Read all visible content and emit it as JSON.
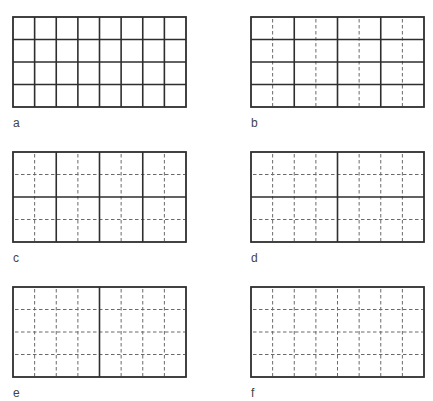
{
  "figure": {
    "grid": {
      "cols": 8,
      "rows": 4,
      "width": 173,
      "height": 90
    },
    "colors": {
      "solid": "#2e2e2e",
      "dashed": "#6a6a6a",
      "background": "#ffffff"
    },
    "panels": [
      {
        "label": "a",
        "x": 13,
        "y": 17,
        "solid_v": [
          1,
          2,
          3,
          4,
          5,
          6,
          7
        ],
        "solid_h": [
          1,
          2,
          3
        ],
        "dashed_v": [],
        "dashed_h": []
      },
      {
        "label": "b",
        "x": 251,
        "y": 17,
        "solid_v": [
          2,
          4,
          6
        ],
        "solid_h": [
          1,
          2,
          3
        ],
        "dashed_v": [
          1,
          3,
          5,
          7
        ],
        "dashed_h": []
      },
      {
        "label": "c",
        "x": 13,
        "y": 152,
        "solid_v": [
          2,
          4,
          6
        ],
        "solid_h": [
          2
        ],
        "dashed_v": [
          1,
          3,
          5,
          7
        ],
        "dashed_h": [
          1,
          3
        ]
      },
      {
        "label": "d",
        "x": 251,
        "y": 152,
        "solid_v": [
          4
        ],
        "solid_h": [
          2
        ],
        "dashed_v": [
          1,
          2,
          3,
          5,
          6,
          7
        ],
        "dashed_h": [
          1,
          3
        ]
      },
      {
        "label": "e",
        "x": 13,
        "y": 287,
        "solid_v": [
          4
        ],
        "solid_h": [],
        "dashed_v": [
          1,
          2,
          3,
          5,
          6,
          7
        ],
        "dashed_h": [
          1,
          2,
          3
        ]
      },
      {
        "label": "f",
        "x": 251,
        "y": 287,
        "solid_v": [],
        "solid_h": [],
        "dashed_v": [
          1,
          2,
          3,
          4,
          5,
          6,
          7
        ],
        "dashed_h": [
          1,
          2,
          3
        ]
      }
    ]
  }
}
